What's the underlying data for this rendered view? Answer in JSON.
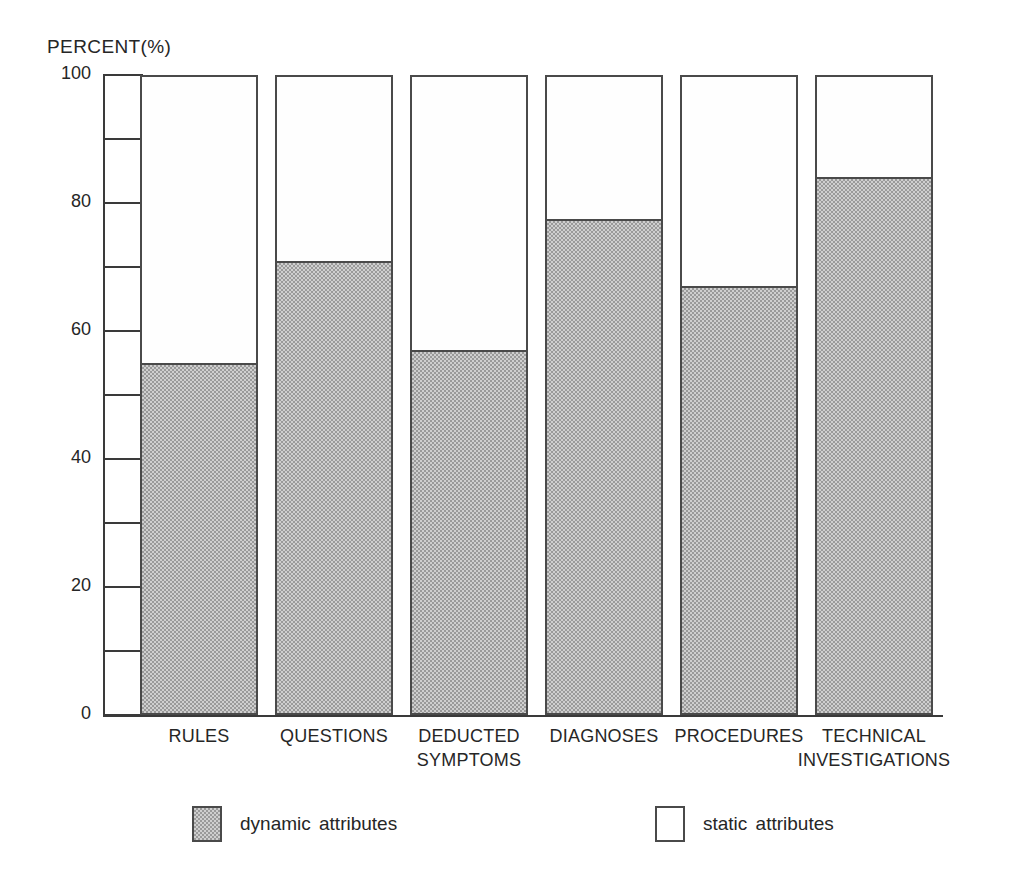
{
  "chart_data": {
    "type": "bar",
    "subtype": "stacked-100-percent",
    "title": "",
    "axis_title": "PERCENT(%)",
    "xlabel": "",
    "ylabel": "PERCENT(%)",
    "ylim": [
      0,
      100
    ],
    "grid": false,
    "legend_position": "bottom",
    "categories": [
      "RULES",
      "QUESTIONS",
      "DEDUCTED SYMPTOMS",
      "DIAGNOSES",
      "PROCEDURES",
      "TECHNICAL INVESTIGATIONS"
    ],
    "category_lines": [
      [
        "RULES"
      ],
      [
        "QUESTIONS"
      ],
      [
        "DEDUCTED",
        "SYMPTOMS"
      ],
      [
        "DIAGNOSES"
      ],
      [
        "PROCEDURES"
      ],
      [
        "TECHNICAL",
        "INVESTIGATIONS"
      ]
    ],
    "series": [
      {
        "name": "dynamic attributes",
        "values": [
          55,
          71,
          57,
          77.5,
          67,
          84
        ],
        "color": "#b4b4b4",
        "fill": "checker-dither"
      },
      {
        "name": "static attributes",
        "values": [
          45,
          29,
          43,
          22.5,
          33,
          16
        ],
        "color": "#ffffff",
        "fill": "solid-white"
      }
    ],
    "y_ticks_major": [
      0,
      20,
      40,
      60,
      80,
      100
    ],
    "y_ticks_minor": [
      10,
      30,
      50,
      70,
      90
    ],
    "y_tick_labels": [
      "0",
      "20",
      "40",
      "60",
      "80",
      "100"
    ]
  },
  "legend": {
    "entries": [
      {
        "label": "dynamic  attributes",
        "swatch": "dynamic"
      },
      {
        "label": "static  attributes",
        "swatch": "static"
      }
    ]
  },
  "colors": {
    "axis": "#3a3a3a",
    "bar_outline": "#4a4a4a",
    "dynamic_fill": "#b4b4b4",
    "static_fill": "#ffffff",
    "text": "#262626",
    "background": "#ffffff"
  }
}
